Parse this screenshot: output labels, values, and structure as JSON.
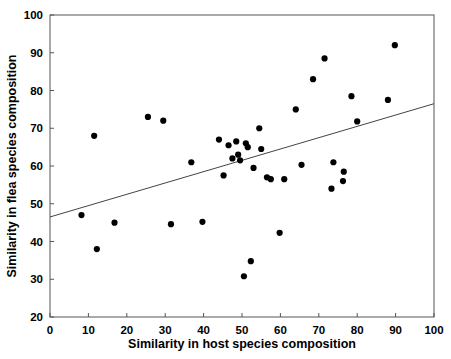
{
  "chart_data": {
    "type": "scatter",
    "title": "",
    "xlabel": "Similarity in host species composition",
    "ylabel": "Similarity in flea species composition",
    "xlim": [
      0,
      100
    ],
    "ylim": [
      20,
      100
    ],
    "xticks": [
      0,
      10,
      20,
      30,
      40,
      50,
      60,
      70,
      80,
      90,
      100
    ],
    "yticks": [
      20,
      30,
      40,
      50,
      60,
      70,
      80,
      90,
      100
    ],
    "xtick_labels": [
      "0",
      "10",
      "20",
      "30",
      "40",
      "50",
      "60",
      "70",
      "80",
      "90",
      "100"
    ],
    "ytick_labels": [
      "20",
      "30",
      "40",
      "50",
      "60",
      "70",
      "80",
      "90",
      "100"
    ],
    "grid": false,
    "legend": false,
    "marker": "filled-circle",
    "marker_color": "#000000",
    "points": [
      [
        8.2,
        47.0
      ],
      [
        11.5,
        68.0
      ],
      [
        12.2,
        38.0
      ],
      [
        16.8,
        45.0
      ],
      [
        25.5,
        73.0
      ],
      [
        29.5,
        72.0
      ],
      [
        31.5,
        44.6
      ],
      [
        36.8,
        61.0
      ],
      [
        39.7,
        45.2
      ],
      [
        44.0,
        67.0
      ],
      [
        45.2,
        57.5
      ],
      [
        46.5,
        65.5
      ],
      [
        47.5,
        62.0
      ],
      [
        48.5,
        66.5
      ],
      [
        49.0,
        63.0
      ],
      [
        49.5,
        61.5
      ],
      [
        50.5,
        30.8
      ],
      [
        51.0,
        66.0
      ],
      [
        51.5,
        65.0
      ],
      [
        52.3,
        34.8
      ],
      [
        53.0,
        59.5
      ],
      [
        54.5,
        70.0
      ],
      [
        55.0,
        64.5
      ],
      [
        56.5,
        57.0
      ],
      [
        57.5,
        56.5
      ],
      [
        59.8,
        42.3
      ],
      [
        61.0,
        56.5
      ],
      [
        64.0,
        75.0
      ],
      [
        65.5,
        60.3
      ],
      [
        68.5,
        83.0
      ],
      [
        71.5,
        88.5
      ],
      [
        73.3,
        54.0
      ],
      [
        73.8,
        61.0
      ],
      [
        76.3,
        56.0
      ],
      [
        76.5,
        58.5
      ],
      [
        78.5,
        78.5
      ],
      [
        80.0,
        71.8
      ],
      [
        88.0,
        77.5
      ],
      [
        89.8,
        92.0
      ]
    ],
    "fit_line": {
      "type": "linear-regression",
      "x_start": 0,
      "y_start": 46.5,
      "x_end": 100,
      "y_end": 76.5,
      "color": "#444444"
    }
  }
}
